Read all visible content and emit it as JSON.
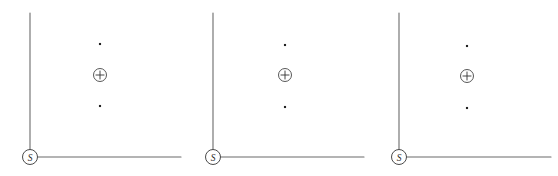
{
  "figure": {
    "background_color": "#ffffff",
    "axis_color": "#6b6b6b",
    "marker_color": "#222222",
    "panel_count": 3,
    "panel_width": 186,
    "panel_height": 176
  },
  "panels": [
    {
      "id": "panel-1",
      "offset_x": 0,
      "origin_label": "S",
      "origin": {
        "x": 30,
        "y": 157
      },
      "vertical_axis": {
        "x": 30,
        "y_top": 13,
        "y_bottom": 157
      },
      "horizontal_axis": {
        "y": 157,
        "x_left": 30,
        "x_right": 181
      },
      "origin_circle_radius": 7.5,
      "markers": [
        {
          "name": "upper-dot",
          "type": "dot",
          "x": 100,
          "y": 44,
          "size": 2.1
        },
        {
          "name": "center-plus",
          "type": "circled-plus",
          "x": 100,
          "y": 75,
          "radius": 6.5
        },
        {
          "name": "lower-dot",
          "type": "dot",
          "x": 100,
          "y": 106,
          "size": 2.1
        }
      ]
    },
    {
      "id": "panel-2",
      "offset_x": 186,
      "origin_label": "S",
      "origin": {
        "x": 27,
        "y": 157
      },
      "vertical_axis": {
        "x": 27,
        "y_top": 13,
        "y_bottom": 157
      },
      "horizontal_axis": {
        "y": 157,
        "x_left": 27,
        "x_right": 178
      },
      "origin_circle_radius": 7.5,
      "markers": [
        {
          "name": "upper-dot",
          "type": "dot",
          "x": 99,
          "y": 45,
          "size": 2.1
        },
        {
          "name": "center-plus",
          "type": "circled-plus",
          "x": 99,
          "y": 75,
          "radius": 6.5
        },
        {
          "name": "lower-dot",
          "type": "dot",
          "x": 99,
          "y": 107,
          "size": 2.1
        }
      ]
    },
    {
      "id": "panel-3",
      "offset_x": 372,
      "origin_label": "S",
      "origin": {
        "x": 27,
        "y": 157
      },
      "vertical_axis": {
        "x": 27,
        "y_top": 13,
        "y_bottom": 157
      },
      "horizontal_axis": {
        "y": 157,
        "x_left": 27,
        "x_right": 179
      },
      "origin_circle_radius": 7.5,
      "markers": [
        {
          "name": "upper-dot",
          "type": "dot",
          "x": 95,
          "y": 46,
          "size": 2.1
        },
        {
          "name": "center-plus",
          "type": "circled-plus",
          "x": 95,
          "y": 76,
          "radius": 6.5
        },
        {
          "name": "lower-dot",
          "type": "dot",
          "x": 95,
          "y": 108,
          "size": 2.1
        }
      ]
    }
  ]
}
